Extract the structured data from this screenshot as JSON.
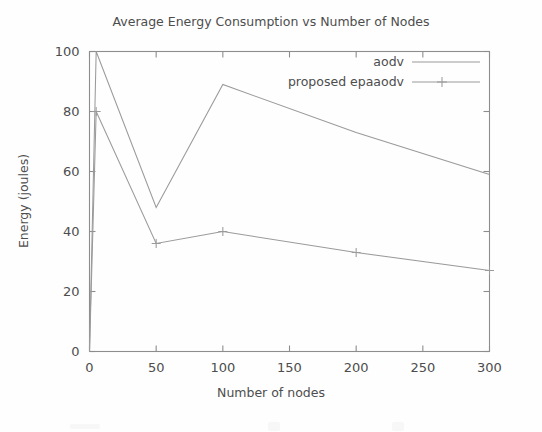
{
  "chart_data": {
    "type": "line",
    "title": "Average Energy Consumption vs Number of Nodes",
    "xlabel": "Number of nodes",
    "ylabel": "Energy (joules)",
    "xlim": [
      0,
      300
    ],
    "ylim": [
      0,
      100
    ],
    "xticks": [
      0,
      50,
      100,
      150,
      200,
      250,
      300
    ],
    "yticks": [
      0,
      20,
      40,
      60,
      80,
      100
    ],
    "xtick_labels": [
      "0",
      "50",
      "100",
      "150",
      "200",
      "250",
      "300"
    ],
    "ytick_labels": [
      "0",
      "20",
      "40",
      "60",
      "80",
      "100"
    ],
    "grid": false,
    "legend_position": "top-right",
    "series": [
      {
        "name": "aodv",
        "marker": "none",
        "color": "#9a9a9a",
        "x": [
          0,
          5,
          50,
          100,
          200,
          300
        ],
        "values": [
          0,
          100,
          48,
          89,
          73,
          59
        ]
      },
      {
        "name": "proposed epaaodv",
        "marker": "plus",
        "color": "#9a9a9a",
        "x": [
          0,
          5,
          50,
          100,
          200,
          300
        ],
        "values": [
          0,
          80,
          36,
          40,
          33,
          27
        ]
      }
    ]
  },
  "legend": {
    "entries": [
      {
        "label": "aodv"
      },
      {
        "label": "proposed epaaodv"
      }
    ]
  },
  "axis": {
    "x_title": "Number of nodes",
    "y_title": "Energy (joules)"
  },
  "header": {
    "title": "Average Energy Consumption vs Number of Nodes"
  }
}
